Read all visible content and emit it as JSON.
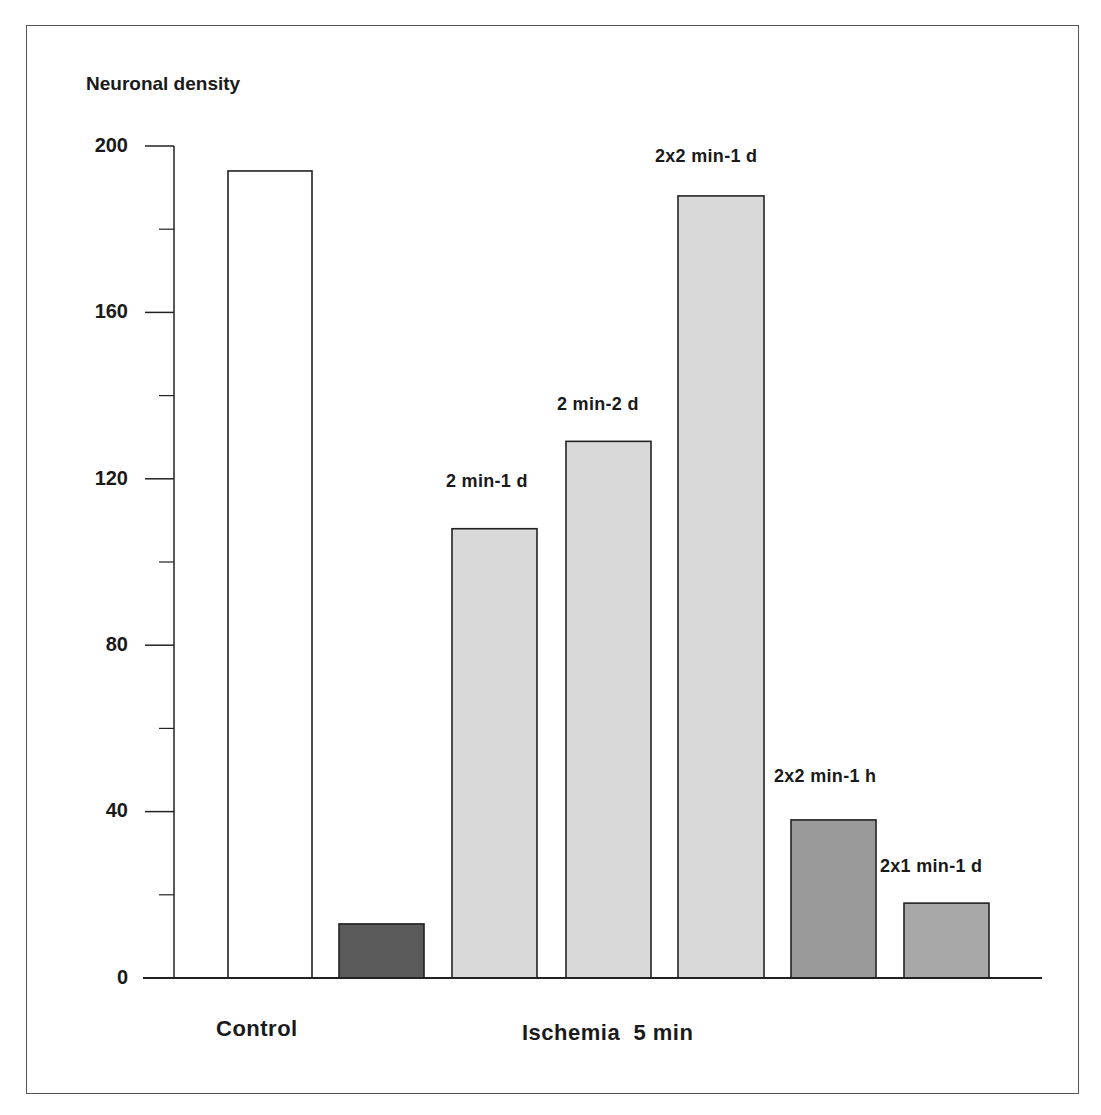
{
  "chart_data": {
    "type": "bar",
    "title": "",
    "ylabel": "Neuronal density",
    "xlabel": "",
    "ylim": [
      0,
      200
    ],
    "yticks": [
      0,
      40,
      80,
      120,
      160,
      200
    ],
    "minor_yticks": [
      20,
      60,
      100,
      140,
      180
    ],
    "grid": false,
    "legend": null,
    "groups": [
      {
        "label": "Control",
        "bars": [
          0
        ]
      },
      {
        "label": "Ischemia  5 min",
        "bars": [
          1,
          2,
          3,
          4,
          5,
          6
        ]
      }
    ],
    "categories": [
      "Control",
      "Ischemia 5 min",
      "2 min-1 d",
      "2 min-2 d",
      "2x2 min-1 d",
      "2x2 min-1 h",
      "2x1 min-1 d"
    ],
    "bar_labels": [
      "",
      "",
      "2 min-1 d",
      "2 min-2 d",
      "2x2 min-1 d",
      "2x2 min-1 h",
      "2x1 min-1 d"
    ],
    "values": [
      194,
      13,
      108,
      129,
      188,
      38,
      18
    ],
    "colors": [
      "#ffffff",
      "#5a5a5a",
      "#d9d9d9",
      "#d9d9d9",
      "#d9d9d9",
      "#9a9a9a",
      "#a8a8a8"
    ]
  },
  "axis": {
    "ylabel": "Neuronal density",
    "tick_labels": [
      "0",
      "40",
      "80",
      "120",
      "160",
      "200"
    ]
  },
  "labels": {
    "bar2": "2 min-1 d",
    "bar3": "2 min-2 d",
    "bar4": "2x2 min-1 d",
    "bar5": "2x2 min-1 h",
    "bar6": "2x1 min-1 d",
    "group_control": "Control",
    "group_ischemia": "Ischemia  5 min"
  }
}
